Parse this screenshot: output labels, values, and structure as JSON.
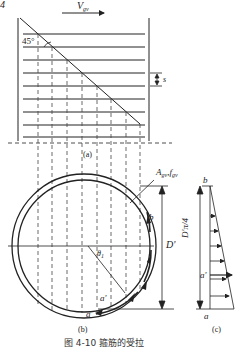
{
  "figure": {
    "panel_a": {
      "label": "(a)",
      "velocity_symbol": "V",
      "velocity_subscript": "gv",
      "angle_label": "45°",
      "spacing_label": "s",
      "corner_mark": "4"
    },
    "panel_b": {
      "label": "(b)",
      "reinforcement_label": "A",
      "reinforcement_subscript": "gv",
      "strength_label": "f",
      "strength_subscript": "gv",
      "diameter_label": "D'",
      "angle_label": "θ",
      "angle_subscript": "1",
      "point_b": "b",
      "point_a": "a",
      "point_a_prime": "a'"
    },
    "panel_c": {
      "label": "(c)",
      "height_label": "D'π/4",
      "point_b": "b",
      "point_a": "a",
      "point_a_prime": "a'"
    },
    "caption": "图 4-10   箍筋的受拉"
  }
}
